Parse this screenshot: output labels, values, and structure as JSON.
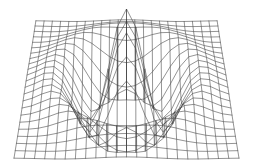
{
  "figure": {
    "title": "",
    "background_color": "#ffffff",
    "line_color": "#3a3a3a",
    "width": 253,
    "height": 168
  },
  "chart_data": {
    "type": "line",
    "subtype": "3d-wireframe-surface",
    "title": "",
    "subtitle": "",
    "xlabel": "",
    "ylabel": "",
    "zlabel": "",
    "grid": false,
    "legend_position": "none",
    "axes_visible": false,
    "tick_labels_visible": false,
    "annotations": [],
    "surface": {
      "function": "z = cos(r) * exp(-r*r/18) * 1.0, r = sqrt(x^2 + y^2)",
      "expression_note": "ripple/mexican-hat style radial surface",
      "x": {
        "min": -7.5,
        "max": 7.5,
        "steps": 22
      },
      "y": {
        "min": -7.5,
        "max": 7.5,
        "steps": 22
      },
      "zlim": [
        -1.0,
        1.0
      ]
    },
    "projection": {
      "type": "perspective",
      "elevation_deg": 22,
      "azimuth_deg": 0,
      "roll_deg": 0,
      "z_scale": 1.0
    },
    "features": [
      {
        "name": "central-plateau",
        "location": "rear-center",
        "relative_height": 1.0
      },
      {
        "name": "left-trough",
        "location": "left",
        "relative_height": -0.62
      },
      {
        "name": "right-trough",
        "location": "right",
        "relative_height": -0.62
      },
      {
        "name": "front-spike",
        "location": "front-center",
        "relative_height": -1.0
      },
      {
        "name": "left-rim-edge",
        "location": "far-left",
        "relative_height": 0.18
      },
      {
        "name": "right-rim-edge",
        "location": "far-right",
        "relative_height": 0.18
      }
    ],
    "grid_lines": {
      "u_count": 23,
      "v_count": 23
    }
  }
}
